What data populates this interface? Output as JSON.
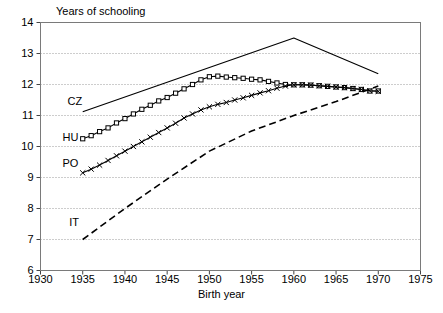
{
  "chart_data": {
    "type": "line",
    "title": "",
    "ylabel": "Years of schooling",
    "xlabel": "Birth year",
    "xlim": [
      1930,
      1975
    ],
    "ylim": [
      6,
      14
    ],
    "xticks": [
      1930,
      1935,
      1940,
      1945,
      1950,
      1955,
      1960,
      1965,
      1970,
      1975
    ],
    "yticks": [
      6,
      7,
      8,
      9,
      10,
      11,
      12,
      13,
      14
    ],
    "grid": "horizontal-dotted",
    "legend": "inline-labels",
    "series": [
      {
        "name": "CZ",
        "label": "CZ",
        "style": "solid",
        "marker": "none",
        "color": "#000000",
        "x": [
          1935,
          1960,
          1970
        ],
        "values": [
          11.12,
          13.5,
          12.35
        ]
      },
      {
        "name": "HU",
        "label": "HU",
        "style": "solid",
        "marker": "square",
        "color": "#000000",
        "x": [
          1935,
          1936,
          1937,
          1938,
          1939,
          1940,
          1941,
          1942,
          1943,
          1944,
          1945,
          1946,
          1947,
          1948,
          1949,
          1950,
          1951,
          1952,
          1953,
          1954,
          1955,
          1956,
          1957,
          1958,
          1959,
          1960,
          1961,
          1962,
          1963,
          1964,
          1965,
          1966,
          1967,
          1968,
          1969,
          1970
        ],
        "values": [
          10.25,
          10.35,
          10.48,
          10.6,
          10.76,
          10.9,
          11.05,
          11.2,
          11.33,
          11.47,
          11.58,
          11.72,
          11.86,
          12.0,
          12.15,
          12.25,
          12.27,
          12.24,
          12.22,
          12.2,
          12.17,
          12.15,
          12.1,
          12.05,
          12.0,
          11.99,
          11.99,
          11.98,
          11.96,
          11.94,
          11.92,
          11.9,
          11.87,
          11.84,
          11.79,
          11.79
        ]
      },
      {
        "name": "PO",
        "label": "PO",
        "style": "solid",
        "marker": "plus",
        "color": "#000000",
        "x": [
          1935,
          1936,
          1937,
          1938,
          1939,
          1940,
          1941,
          1942,
          1943,
          1944,
          1945,
          1946,
          1947,
          1948,
          1949,
          1950,
          1951,
          1952,
          1953,
          1954,
          1955,
          1956,
          1957,
          1958,
          1959,
          1960,
          1961,
          1962,
          1963,
          1964,
          1965,
          1966,
          1967,
          1968,
          1969,
          1970
        ],
        "values": [
          9.15,
          9.27,
          9.4,
          9.55,
          9.7,
          9.85,
          10.0,
          10.15,
          10.3,
          10.45,
          10.6,
          10.75,
          10.92,
          11.05,
          11.18,
          11.28,
          11.36,
          11.42,
          11.5,
          11.57,
          11.65,
          11.73,
          11.8,
          11.88,
          11.95,
          11.99,
          11.99,
          11.98,
          11.96,
          11.94,
          11.92,
          11.9,
          11.87,
          11.84,
          11.8,
          11.78
        ]
      },
      {
        "name": "IT",
        "label": "IT",
        "style": "dashed",
        "marker": "none",
        "color": "#000000",
        "x": [
          1935,
          1940,
          1945,
          1950,
          1955,
          1960,
          1965,
          1970
        ],
        "values": [
          7.0,
          8.0,
          8.95,
          9.85,
          10.5,
          11.0,
          11.45,
          11.95
        ]
      }
    ],
    "series_label_positions": [
      {
        "name": "CZ",
        "x": 1933.2,
        "y": 11.45
      },
      {
        "name": "HU",
        "x": 1932.6,
        "y": 10.3
      },
      {
        "name": "PO",
        "x": 1932.6,
        "y": 9.45
      },
      {
        "name": "IT",
        "x": 1933.4,
        "y": 7.55
      }
    ]
  }
}
